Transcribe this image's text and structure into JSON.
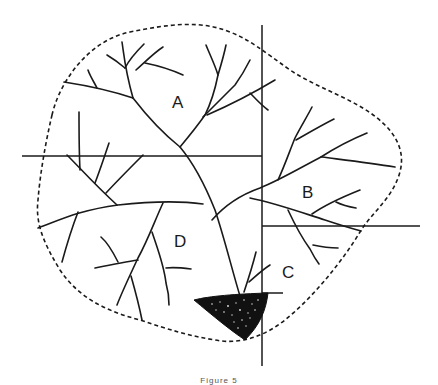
{
  "figure": {
    "caption": "Figure 5",
    "regions": [
      {
        "id": "A",
        "label": "A",
        "x": 172,
        "y": 108
      },
      {
        "id": "B",
        "label": "B",
        "x": 302,
        "y": 198
      },
      {
        "id": "C",
        "label": "C",
        "x": 282,
        "y": 278
      },
      {
        "id": "D",
        "label": "D",
        "x": 174,
        "y": 247
      }
    ],
    "dividers": {
      "vertical": {
        "x": 262,
        "y1": 25,
        "y2": 366
      },
      "horizontal_left": {
        "x1": 22,
        "x2": 262,
        "y": 156
      },
      "horizontal_right": {
        "x1": 262,
        "x2": 420,
        "y": 226
      },
      "pond_top": {
        "x1": 262,
        "x2": 283,
        "y": 293
      }
    },
    "pond": {
      "description": "dark triangular pond / outlet area",
      "color": "#111111"
    }
  }
}
